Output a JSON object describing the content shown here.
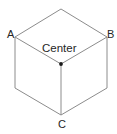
{
  "figure": {
    "background_color": "#ffffff",
    "edge_color": "#8c8c8c",
    "label_color": "#262626",
    "center_dot_color": "#1a1a1a",
    "labels": {
      "a": "A",
      "b": "B",
      "c": "C",
      "center": "Center"
    },
    "geometry": {
      "projection": "isometric",
      "width": 117,
      "height": 134,
      "points": {
        "top": [
          61,
          9
        ],
        "left_upper": [
          15,
          37
        ],
        "right_upper": [
          107,
          37
        ],
        "center": [
          61,
          64
        ],
        "left_lower": [
          15,
          88
        ],
        "right_lower": [
          107,
          88
        ],
        "bottom": [
          61,
          115
        ]
      },
      "edges": [
        [
          "left_upper",
          "top"
        ],
        [
          "top",
          "right_upper"
        ],
        [
          "left_upper",
          "center"
        ],
        [
          "right_upper",
          "center"
        ],
        [
          "center",
          "bottom"
        ],
        [
          "left_upper",
          "left_lower"
        ],
        [
          "right_upper",
          "right_lower"
        ],
        [
          "left_lower",
          "bottom"
        ],
        [
          "right_lower",
          "bottom"
        ]
      ]
    }
  }
}
